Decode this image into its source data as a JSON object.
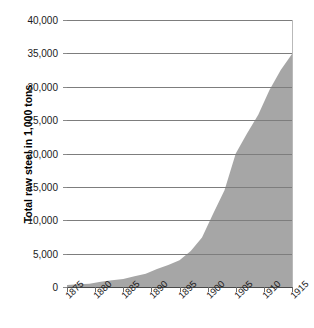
{
  "title_fragment": "",
  "axes": {
    "y_title": "Total raw steel in 1,000 tons",
    "y_ticks": [
      "0",
      "5,000",
      "10,000",
      "15,000",
      "20,000",
      "25,000",
      "30,000",
      "35,000",
      "40,000"
    ],
    "x_ticks": [
      "1875",
      "1880",
      "1885",
      "1890",
      "1895",
      "1900",
      "1905",
      "1910",
      "1915"
    ]
  },
  "colors": {
    "area_fill": "#a6a6a6",
    "gridline": "#7d7d7d",
    "axis": "#4a4a4a",
    "text": "#1a1a1a",
    "background": "#ffffff"
  },
  "chart_data": {
    "type": "area",
    "title": "",
    "xlabel": "",
    "ylabel": "Total raw steel in 1,000 tons",
    "xlim": [
      1875,
      1915
    ],
    "ylim": [
      0,
      40000
    ],
    "grid": true,
    "legend": "none",
    "x": [
      1875,
      1880,
      1885,
      1890,
      1895,
      1900,
      1905,
      1910,
      1915
    ],
    "values": [
      300,
      700,
      1200,
      2300,
      4000,
      10000,
      20000,
      27500,
      34900
    ],
    "x_detailed": [
      1875,
      1877,
      1879,
      1881,
      1883,
      1885,
      1887,
      1889,
      1891,
      1893,
      1895,
      1897,
      1899,
      1901,
      1903,
      1905,
      1907,
      1909,
      1911,
      1913,
      1915
    ],
    "values_detailed": [
      300,
      400,
      500,
      800,
      1000,
      1200,
      1600,
      2000,
      2700,
      3300,
      4000,
      5400,
      7400,
      11000,
      14500,
      20000,
      23000,
      25800,
      29500,
      32500,
      34900
    ],
    "units": "1,000 tons"
  }
}
